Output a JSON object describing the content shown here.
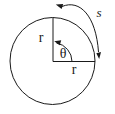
{
  "diagram": {
    "labels": {
      "radius_vertical": "r",
      "radius_horizontal": "r",
      "angle": "θ",
      "arc_length": "s"
    },
    "colors": {
      "stroke": "#1a1a1a",
      "background": "#ffffff"
    }
  }
}
